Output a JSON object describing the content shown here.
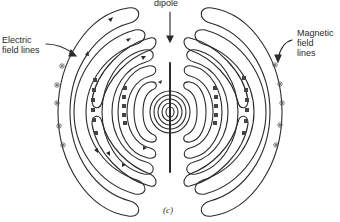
{
  "figure": {
    "caption": "(c)",
    "labels": {
      "dipole": "dipole",
      "electric_line1": "Electric",
      "electric_line2": "field lines",
      "magnetic_line1": "Magnetic",
      "magnetic_line2": "field",
      "magnetic_line3": "lines"
    },
    "colors": {
      "stroke": "#2a2a2a",
      "background": "#ffffff"
    },
    "elements": {
      "antenna": "vertical dipole antenna at center",
      "electric_field_loops": "nested closed loops radiating outward on left and right",
      "magnetic_field_symbols": "circled-dot and boxed-x markers between loops"
    }
  }
}
